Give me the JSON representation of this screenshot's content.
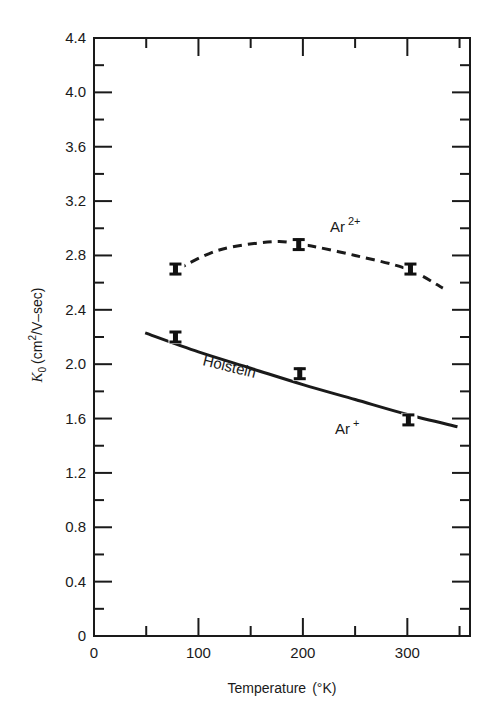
{
  "chart_data": {
    "type": "line",
    "title": "",
    "xlabel": "Temperature (°K)",
    "ylabel": "K0 (cm2/V–sec)",
    "xlim": [
      0,
      360
    ],
    "ylim": [
      0,
      4.4
    ],
    "x_ticks": [
      0,
      100,
      200,
      300
    ],
    "x_minor_ticks": [
      50,
      150,
      250,
      350
    ],
    "y_ticks": [
      0,
      0.4,
      0.8,
      1.2,
      1.6,
      2.0,
      2.4,
      2.8,
      3.2,
      3.6,
      4.0,
      4.4
    ],
    "y_tick_labels": [
      "0",
      "0.4",
      "0.8",
      "1.2",
      "1.6",
      "2.0",
      "2.4",
      "2.8",
      "3.2",
      "3.6",
      "4.0",
      "4.4"
    ],
    "x_tick_labels": [
      "0",
      "100",
      "200",
      "300"
    ],
    "grid": false,
    "legend": "none (inline annotations)",
    "series": [
      {
        "name": "Ar2+",
        "style": "dashed",
        "points": [
          {
            "x": 78,
            "y": 2.7
          },
          {
            "x": 196,
            "y": 2.88
          },
          {
            "x": 303,
            "y": 2.7
          }
        ],
        "curve": [
          {
            "x": 80,
            "y": 2.7
          },
          {
            "x": 120,
            "y": 2.84
          },
          {
            "x": 170,
            "y": 2.9
          },
          {
            "x": 200,
            "y": 2.88
          },
          {
            "x": 250,
            "y": 2.8
          },
          {
            "x": 300,
            "y": 2.7
          },
          {
            "x": 334,
            "y": 2.56
          }
        ]
      },
      {
        "name": "Ar+",
        "style": "solid",
        "fit_label": "Holstein",
        "points": [
          {
            "x": 78,
            "y": 2.2
          },
          {
            "x": 197,
            "y": 1.93
          },
          {
            "x": 301,
            "y": 1.59
          }
        ],
        "curve": [
          {
            "x": 49,
            "y": 2.23
          },
          {
            "x": 100,
            "y": 2.09
          },
          {
            "x": 150,
            "y": 1.97
          },
          {
            "x": 200,
            "y": 1.85
          },
          {
            "x": 250,
            "y": 1.74
          },
          {
            "x": 300,
            "y": 1.63
          },
          {
            "x": 348,
            "y": 1.54
          }
        ]
      }
    ],
    "annotations": [
      {
        "text": "Ar",
        "sup": "2+",
        "near": "dashed curve, T≈250–280"
      },
      {
        "text": "Holstein",
        "near": "solid curve, T≈120–180, rotated along line"
      },
      {
        "text": "Ar",
        "sup": "+",
        "near": "solid curve, T≈240–270"
      }
    ]
  },
  "labels": {
    "xlabel": "Temperature",
    "xlabel_unit": "(°K)",
    "ylabel_k": "K",
    "ylabel_sub": "0",
    "ylabel_unit_pre": "(cm",
    "ylabel_sup": "2",
    "ylabel_unit_post": "/V–sec)",
    "ar2_base": "Ar",
    "ar2_sup": "2+",
    "ar1_base": "Ar",
    "ar1_sup": "+",
    "holstein": "Holstein"
  }
}
